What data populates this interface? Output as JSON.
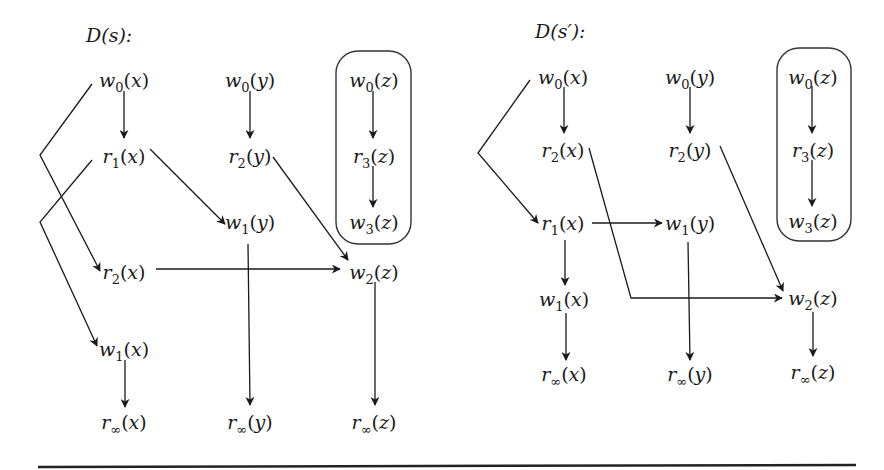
{
  "diagrams": [
    {
      "id": "left",
      "title": "D(s):",
      "title_pos": [
        86,
        42
      ],
      "box": {
        "x": 336,
        "y": 51,
        "w": 75,
        "h": 193,
        "r": 22
      },
      "nodes": [
        {
          "id": "w0x",
          "op": "w",
          "sub": "0",
          "var": "x",
          "x": 124,
          "y": 80
        },
        {
          "id": "r1x",
          "op": "r",
          "sub": "1",
          "var": "x",
          "x": 124,
          "y": 156
        },
        {
          "id": "r2x",
          "op": "r",
          "sub": "2",
          "var": "x",
          "x": 124,
          "y": 272
        },
        {
          "id": "w1x",
          "op": "w",
          "sub": "1",
          "var": "x",
          "x": 124,
          "y": 349
        },
        {
          "id": "rinfx",
          "op": "r",
          "sub": "∞",
          "var": "x",
          "x": 124,
          "y": 422
        },
        {
          "id": "w0y",
          "op": "w",
          "sub": "0",
          "var": "y",
          "x": 250,
          "y": 80
        },
        {
          "id": "r2y",
          "op": "r",
          "sub": "2",
          "var": "y",
          "x": 250,
          "y": 156
        },
        {
          "id": "w1y",
          "op": "w",
          "sub": "1",
          "var": "y",
          "x": 250,
          "y": 222
        },
        {
          "id": "rinfy",
          "op": "r",
          "sub": "∞",
          "var": "y",
          "x": 250,
          "y": 422
        },
        {
          "id": "w0z",
          "op": "w",
          "sub": "0",
          "var": "z",
          "x": 374,
          "y": 80
        },
        {
          "id": "r3z",
          "op": "r",
          "sub": "3",
          "var": "z",
          "x": 374,
          "y": 156
        },
        {
          "id": "w3z",
          "op": "w",
          "sub": "3",
          "var": "z",
          "x": 374,
          "y": 222
        },
        {
          "id": "w2z",
          "op": "w",
          "sub": "2",
          "var": "z",
          "x": 374,
          "y": 272
        },
        {
          "id": "rinfz",
          "op": "r",
          "sub": "∞",
          "var": "z",
          "x": 374,
          "y": 422
        }
      ],
      "edges": [
        {
          "from": "w0x",
          "to": "r1x",
          "points": [
            [
              124,
              91
            ],
            [
              124,
              138
            ]
          ]
        },
        {
          "from": "w0x",
          "to": "r2x",
          "points": [
            [
              92,
              84
            ],
            [
              40,
              155
            ],
            [
              100,
              271
            ]
          ]
        },
        {
          "from": "r1x",
          "to": "w1x",
          "points": [
            [
              92,
              160
            ],
            [
              40,
              222
            ],
            [
              97,
              346
            ]
          ]
        },
        {
          "from": "r1x",
          "to": "w1y",
          "points": [
            [
              150,
              149
            ],
            [
              225,
              224
            ]
          ]
        },
        {
          "from": "w0y",
          "to": "r2y",
          "points": [
            [
              250,
              91
            ],
            [
              250,
              138
            ]
          ]
        },
        {
          "from": "r2y",
          "to": "w2z",
          "points": [
            [
              273,
              157
            ],
            [
              348,
              260
            ]
          ]
        },
        {
          "from": "r2x",
          "to": "w2z",
          "points": [
            [
              156,
              269
            ],
            [
              340,
              269
            ]
          ]
        },
        {
          "from": "w1y",
          "to": "rinfy",
          "points": [
            [
              248,
              244
            ],
            [
              250,
              405
            ]
          ]
        },
        {
          "from": "w0z",
          "to": "r3z",
          "points": [
            [
              373,
              91
            ],
            [
              373,
              138
            ]
          ]
        },
        {
          "from": "r3z",
          "to": "w3z",
          "points": [
            [
              373,
              166
            ],
            [
              373,
              207
            ]
          ]
        },
        {
          "from": "w2z",
          "to": "rinfz",
          "points": [
            [
              375,
              282
            ],
            [
              375,
              405
            ]
          ]
        },
        {
          "from": "w1x",
          "to": "rinfx",
          "points": [
            [
              125,
              360
            ],
            [
              125,
              407
            ]
          ]
        }
      ]
    },
    {
      "id": "right",
      "title": "D(s′):",
      "title_pos": [
        535,
        38
      ],
      "box": {
        "x": 777,
        "y": 48,
        "w": 74,
        "h": 193,
        "r": 22
      },
      "nodes": [
        {
          "id": "w0x",
          "op": "w",
          "sub": "0",
          "var": "x",
          "x": 563,
          "y": 77
        },
        {
          "id": "r2x",
          "op": "r",
          "sub": "2",
          "var": "x",
          "x": 563,
          "y": 150
        },
        {
          "id": "r1x",
          "op": "r",
          "sub": "1",
          "var": "x",
          "x": 563,
          "y": 223
        },
        {
          "id": "w1x",
          "op": "w",
          "sub": "1",
          "var": "x",
          "x": 564,
          "y": 299
        },
        {
          "id": "rinfx",
          "op": "r",
          "sub": "∞",
          "var": "x",
          "x": 564,
          "y": 374
        },
        {
          "id": "w0y",
          "op": "w",
          "sub": "0",
          "var": "y",
          "x": 690,
          "y": 77
        },
        {
          "id": "r2y",
          "op": "r",
          "sub": "2",
          "var": "y",
          "x": 690,
          "y": 150
        },
        {
          "id": "w1y",
          "op": "w",
          "sub": "1",
          "var": "y",
          "x": 690,
          "y": 223
        },
        {
          "id": "rinfy",
          "op": "r",
          "sub": "∞",
          "var": "y",
          "x": 690,
          "y": 374
        },
        {
          "id": "w0z",
          "op": "w",
          "sub": "0",
          "var": "z",
          "x": 813,
          "y": 77
        },
        {
          "id": "r3z",
          "op": "r",
          "sub": "3",
          "var": "z",
          "x": 813,
          "y": 150
        },
        {
          "id": "w3z",
          "op": "w",
          "sub": "3",
          "var": "z",
          "x": 813,
          "y": 221
        },
        {
          "id": "w2z",
          "op": "w",
          "sub": "2",
          "var": "z",
          "x": 813,
          "y": 298
        },
        {
          "id": "rinfz",
          "op": "r",
          "sub": "∞",
          "var": "z",
          "x": 813,
          "y": 372
        }
      ],
      "edges": [
        {
          "from": "w0x",
          "to": "r2x",
          "points": [
            [
              564,
              87
            ],
            [
              564,
              133
            ]
          ]
        },
        {
          "from": "w0x",
          "to": "r1x",
          "points": [
            [
              530,
              80
            ],
            [
              478,
              153
            ],
            [
              538,
              223
            ]
          ]
        },
        {
          "from": "r1x",
          "to": "w1y",
          "points": [
            [
              592,
              223
            ],
            [
              662,
              223
            ]
          ]
        },
        {
          "from": "r1x",
          "to": "w1x",
          "points": [
            [
              565,
              240
            ],
            [
              565,
              285
            ]
          ]
        },
        {
          "from": "w1x",
          "to": "rinfx",
          "points": [
            [
              566,
              313
            ],
            [
              566,
              360
            ]
          ]
        },
        {
          "from": "r2x",
          "to": "w2z",
          "points": [
            [
              589,
              148
            ],
            [
              631,
              298
            ],
            [
              782,
              298
            ]
          ]
        },
        {
          "from": "w0y",
          "to": "r2y",
          "points": [
            [
              690,
              87
            ],
            [
              690,
              133
            ]
          ]
        },
        {
          "from": "r2y",
          "to": "w2z",
          "points": [
            [
              720,
              146
            ],
            [
              783,
              291
            ]
          ]
        },
        {
          "from": "w1y",
          "to": "rinfy",
          "points": [
            [
              688,
              242
            ],
            [
              690,
              360
            ]
          ]
        },
        {
          "from": "w0z",
          "to": "r3z",
          "points": [
            [
              812,
              86
            ],
            [
              812,
              133
            ]
          ]
        },
        {
          "from": "r3z",
          "to": "w3z",
          "points": [
            [
              812,
              160
            ],
            [
              812,
              206
            ]
          ]
        },
        {
          "from": "w2z",
          "to": "rinfz",
          "points": [
            [
              813,
              312
            ],
            [
              813,
              356
            ]
          ]
        }
      ]
    }
  ],
  "rule": {
    "x1": 38,
    "y1": 467,
    "x2": 856,
    "y2": 465
  }
}
